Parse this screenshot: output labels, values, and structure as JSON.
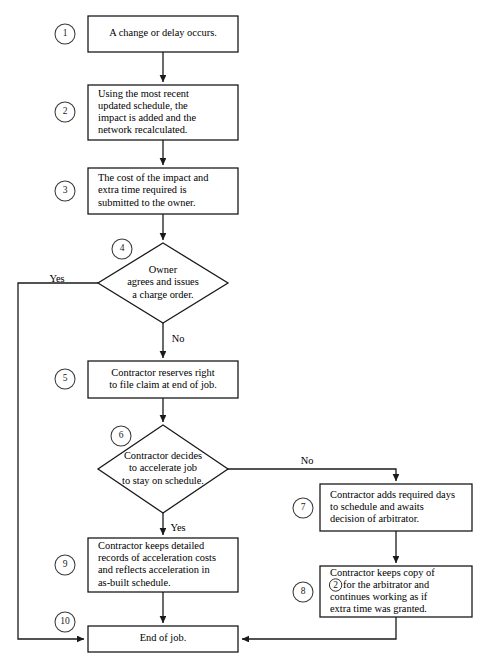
{
  "figure": {
    "kind": "flowchart",
    "caption": "",
    "background_color": "#ffffff",
    "line_color": "#1a1a1a"
  },
  "nodes": [
    {
      "id": "n1",
      "step": "1",
      "shape": "rectangle",
      "align": "center",
      "lines": [
        "A change or delay occurs."
      ],
      "x": 88,
      "y": 16,
      "w": 150,
      "h": 36,
      "circle_x": 65,
      "circle_y": 34
    },
    {
      "id": "n2",
      "step": "2",
      "shape": "rectangle",
      "align": "left",
      "lines": [
        "Using the most recent",
        "updated schedule, the",
        "impact is added and the",
        "network recalculated."
      ],
      "x": 88,
      "y": 85,
      "w": 150,
      "h": 55,
      "circle_x": 65,
      "circle_y": 112
    },
    {
      "id": "n3",
      "step": "3",
      "shape": "rectangle",
      "align": "left",
      "lines": [
        "The cost of the impact and",
        "extra time required is",
        "submitted to the owner."
      ],
      "x": 88,
      "y": 168,
      "w": 150,
      "h": 46,
      "circle_x": 65,
      "circle_y": 191
    },
    {
      "id": "n4",
      "step": "4",
      "shape": "diamond",
      "align": "center",
      "lines": [
        "Owner",
        "agrees and issues",
        "a charge order."
      ],
      "cx": 163,
      "cy": 283,
      "rx": 65,
      "ry": 40,
      "circle_x": 122,
      "circle_y": 249
    },
    {
      "id": "n5",
      "step": "5",
      "shape": "rectangle",
      "align": "center",
      "lines": [
        "Contractor reserves right",
        "to file claim at end of job."
      ],
      "x": 88,
      "y": 361,
      "w": 150,
      "h": 37,
      "circle_x": 65,
      "circle_y": 379
    },
    {
      "id": "n6",
      "step": "6",
      "shape": "diamond",
      "align": "center",
      "lines": [
        "Contractor decides",
        "to accelerate job",
        "to stay on schedule."
      ],
      "cx": 163,
      "cy": 469,
      "rx": 65,
      "ry": 44,
      "circle_x": 121,
      "circle_y": 436
    },
    {
      "id": "n7",
      "step": "7",
      "shape": "rectangle",
      "align": "left",
      "lines": [
        "Contractor adds required days",
        "to schedule and awaits",
        "decision of arbitrator."
      ],
      "x": 320,
      "y": 484,
      "w": 152,
      "h": 47,
      "circle_x": 303,
      "circle_y": 508
    },
    {
      "id": "n8",
      "step": "8",
      "shape": "rectangle",
      "align": "left",
      "ref_line_index": 1,
      "ref_symbol": "2",
      "lines": [
        "Contractor keeps copy of",
        "for the arbitrator and",
        "continues working as if",
        "extra time was granted."
      ],
      "x": 320,
      "y": 566,
      "w": 152,
      "h": 51,
      "circle_x": 303,
      "circle_y": 592
    },
    {
      "id": "n9",
      "step": "9",
      "shape": "rectangle",
      "align": "left",
      "lines": [
        "Contractor keeps detailed",
        "records of acceleration costs",
        "and reflects acceleration in",
        "as-built schedule."
      ],
      "x": 88,
      "y": 538,
      "w": 150,
      "h": 54,
      "circle_x": 65,
      "circle_y": 565
    },
    {
      "id": "n10",
      "step": "10",
      "shape": "rectangle",
      "align": "center",
      "lines": [
        "End of job."
      ],
      "x": 88,
      "y": 626,
      "w": 150,
      "h": 26,
      "circle_x": 65,
      "circle_y": 622
    }
  ],
  "branch_labels": [
    {
      "id": "yes4",
      "text": "Yes",
      "x": 57,
      "y": 280
    },
    {
      "id": "no4",
      "text": "No",
      "x": 178,
      "y": 340
    },
    {
      "id": "no6",
      "text": "No",
      "x": 307,
      "y": 462
    },
    {
      "id": "yes6",
      "text": "Yes",
      "x": 178,
      "y": 529
    }
  ],
  "connectors": [
    {
      "id": "c1-2",
      "from": "n1",
      "to": "n2",
      "path": "M163,52 L163,82",
      "arrow": true
    },
    {
      "id": "c2-3",
      "from": "n2",
      "to": "n3",
      "path": "M163,140 L163,165",
      "arrow": true
    },
    {
      "id": "c3-4",
      "from": "n3",
      "to": "n4",
      "path": "M163,214 L163,240",
      "arrow": true
    },
    {
      "id": "c4-yes",
      "from": "n4",
      "to": "n10",
      "path": "M98,283 L18,283 L18,639 L84,639",
      "arrow": true
    },
    {
      "id": "c4-no",
      "from": "n4",
      "to": "n5",
      "path": "M163,323 L163,358",
      "arrow": true
    },
    {
      "id": "c5-6",
      "from": "n5",
      "to": "n6",
      "path": "M163,398 L163,422",
      "arrow": true
    },
    {
      "id": "c6-no",
      "from": "n6",
      "to": "n7",
      "path": "M228,469 L396,469 L396,481",
      "arrow": true
    },
    {
      "id": "c6-yes",
      "from": "n6",
      "to": "n9",
      "path": "M163,513 L163,535",
      "arrow": true
    },
    {
      "id": "c7-8",
      "from": "n7",
      "to": "n8",
      "path": "M396,531 L396,563",
      "arrow": true
    },
    {
      "id": "c9-10",
      "from": "n9",
      "to": "n10",
      "path": "M163,592 L163,623",
      "arrow": true
    },
    {
      "id": "c8-10",
      "from": "n8",
      "to": "n10",
      "path": "M396,617 L396,639 L242,639",
      "arrow": true
    }
  ]
}
